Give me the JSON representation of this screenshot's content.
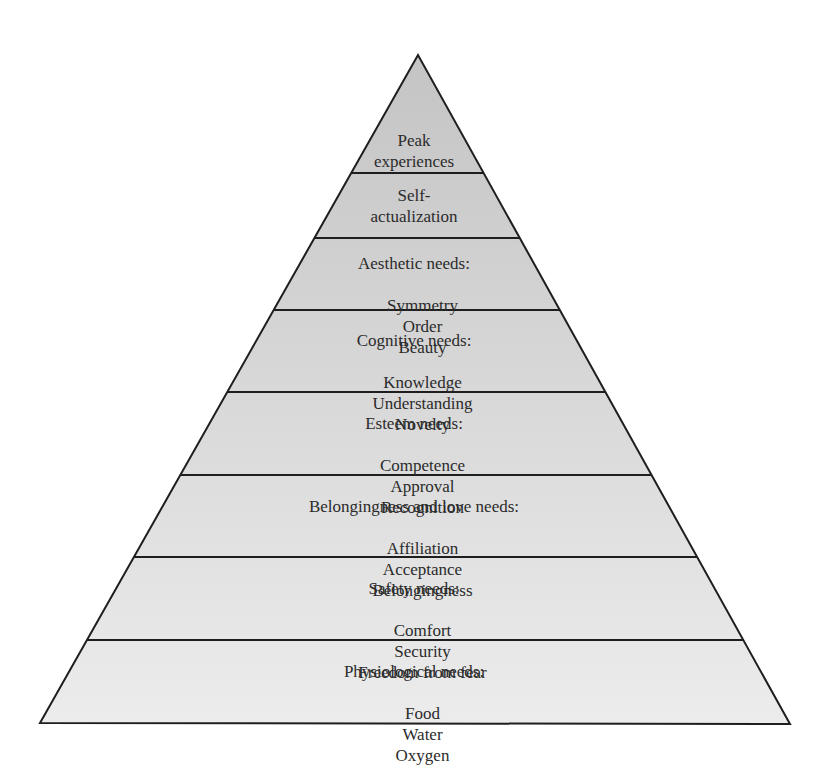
{
  "diagram": {
    "type": "pyramid",
    "geometry": {
      "apex": [
        418,
        55
      ],
      "base_left": [
        40,
        723
      ],
      "base_right": [
        790,
        724
      ],
      "dividers_y": [
        173,
        238,
        310,
        392,
        475,
        557,
        640
      ]
    },
    "colors": {
      "fill_top": "#c4c4c4",
      "fill_bottom": "#ececec",
      "stroke": "#1e1e1e",
      "text": "#2b2b2b"
    },
    "tiers": [
      {
        "level": 8,
        "title": "Peak",
        "title_line2": "experiences",
        "items": []
      },
      {
        "level": 7,
        "title": "Self-",
        "title_line2": "actualization",
        "items": []
      },
      {
        "level": 6,
        "title": "Aesthetic needs:",
        "items": [
          "Symmetry",
          "Order",
          "Beauty"
        ]
      },
      {
        "level": 5,
        "title": "Cognitive needs:",
        "items": [
          "Knowledge",
          "Understanding",
          "Novelty"
        ]
      },
      {
        "level": 4,
        "title": "Esteem needs:",
        "items": [
          "Competence",
          "Approval",
          "Recognition"
        ]
      },
      {
        "level": 3,
        "title": "Belongingness and love needs:",
        "items": [
          "Affiliation",
          "Acceptance",
          "Belongingness"
        ]
      },
      {
        "level": 2,
        "title": "Safety needs:",
        "items": [
          "Comfort",
          "Security",
          "Freedom from fear"
        ]
      },
      {
        "level": 1,
        "title": "Physiological needs:",
        "items": [
          "Food",
          "Water",
          "Oxygen"
        ]
      }
    ]
  }
}
